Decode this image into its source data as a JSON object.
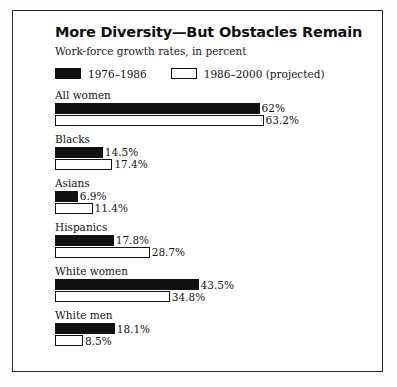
{
  "chart_data": {
    "type": "bar",
    "title": "More Diversity—But Obstacles Remain",
    "subtitle": "Work-force growth rates, in percent",
    "xlabel": "",
    "ylabel": "",
    "grid": false,
    "legend_position": "top",
    "orientation": "horizontal",
    "unit": "%",
    "axis_max": 70,
    "px_per_percent": 3.3,
    "categories": [
      "All women",
      "Blacks",
      "Asians",
      "Hispanics",
      "White women",
      "White men"
    ],
    "series": [
      {
        "name": "1976–1986",
        "color": "#111111",
        "values": [
          62,
          14.5,
          6.9,
          17.8,
          43.5,
          18.1
        ],
        "labels": [
          "62%",
          "14.5%",
          "6.9%",
          "17.8%",
          "43.5%",
          "18.1%"
        ]
      },
      {
        "name": "1986–2000 (projected)",
        "color": "#ffffff",
        "values": [
          63.2,
          17.4,
          11.4,
          28.7,
          34.8,
          8.5
        ],
        "labels": [
          "63.2%",
          "17.4%",
          "11.4%",
          "28.7%",
          "34.8%",
          "8.5%"
        ]
      }
    ]
  },
  "legend": {
    "items": [
      {
        "label": "1976–1986",
        "style": "solid"
      },
      {
        "label": "1986–2000 (projected)",
        "style": "hollow"
      }
    ]
  },
  "groups": [
    {
      "label": "All women",
      "past": {
        "value": 62,
        "label": "62%"
      },
      "projected": {
        "value": 63.2,
        "label": "63.2%"
      }
    },
    {
      "label": "Blacks",
      "past": {
        "value": 14.5,
        "label": "14.5%"
      },
      "projected": {
        "value": 17.4,
        "label": "17.4%"
      }
    },
    {
      "label": "Asians",
      "past": {
        "value": 6.9,
        "label": "6.9%"
      },
      "projected": {
        "value": 11.4,
        "label": "11.4%"
      }
    },
    {
      "label": "Hispanics",
      "past": {
        "value": 17.8,
        "label": "17.8%"
      },
      "projected": {
        "value": 28.7,
        "label": "28.7%"
      }
    },
    {
      "label": "White women",
      "past": {
        "value": 43.5,
        "label": "43.5%"
      },
      "projected": {
        "value": 34.8,
        "label": "34.8%"
      }
    },
    {
      "label": "White men",
      "past": {
        "value": 18.1,
        "label": "18.1%"
      },
      "projected": {
        "value": 8.5,
        "label": "8.5%"
      }
    }
  ]
}
